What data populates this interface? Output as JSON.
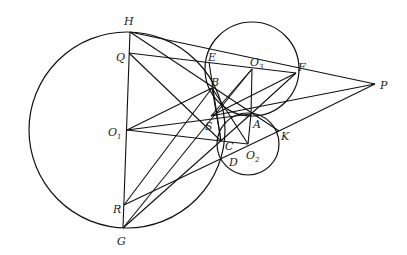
{
  "diagram": {
    "type": "geometry-figure",
    "points": [
      {
        "name": "H",
        "label": "H"
      },
      {
        "name": "Q",
        "label": "Q"
      },
      {
        "name": "O1",
        "label": "O",
        "sub": "1"
      },
      {
        "name": "R",
        "label": "R"
      },
      {
        "name": "G",
        "label": "G"
      },
      {
        "name": "E",
        "label": "E"
      },
      {
        "name": "B",
        "label": "B"
      },
      {
        "name": "O3",
        "label": "O",
        "sub": "3"
      },
      {
        "name": "F",
        "label": "F"
      },
      {
        "name": "P",
        "label": "P"
      },
      {
        "name": "S",
        "label": "S"
      },
      {
        "name": "A",
        "label": "A"
      },
      {
        "name": "K",
        "label": "K"
      },
      {
        "name": "C",
        "label": "C"
      },
      {
        "name": "D",
        "label": "D"
      },
      {
        "name": "O2",
        "label": "O",
        "sub": "2"
      }
    ],
    "circles": [
      {
        "name": "circle-O1",
        "center": "O1"
      },
      {
        "name": "circle-O2",
        "center": "O2"
      },
      {
        "name": "circle-O3",
        "center": "O3"
      }
    ],
    "segments": [
      [
        "H",
        "G"
      ],
      [
        "H",
        "P"
      ],
      [
        "Q",
        "F"
      ],
      [
        "Q",
        "C"
      ],
      [
        "H",
        "K"
      ],
      [
        "O1",
        "A"
      ],
      [
        "O1",
        "C"
      ],
      [
        "O1",
        "B"
      ],
      [
        "O3",
        "A"
      ],
      [
        "O3",
        "S"
      ],
      [
        "F",
        "A"
      ],
      [
        "F",
        "S"
      ],
      [
        "P",
        "S"
      ],
      [
        "P",
        "K"
      ],
      [
        "E",
        "C"
      ],
      [
        "B",
        "C"
      ],
      [
        "B",
        "O2"
      ],
      [
        "C",
        "O2"
      ],
      [
        "A",
        "O2"
      ],
      [
        "R",
        "B"
      ],
      [
        "R",
        "K"
      ],
      [
        "G",
        "O3"
      ],
      [
        "G",
        "A"
      ]
    ]
  }
}
